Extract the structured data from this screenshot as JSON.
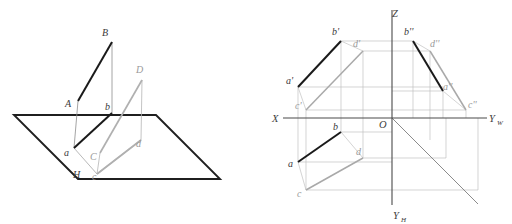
{
  "figure": {
    "colors": {
      "dark": "#232323",
      "medium": "#6f6f6f",
      "light": "#a8a8a8",
      "axis": "#4a4a4a",
      "background": "#ffffff"
    }
  },
  "left_diagram": {
    "name": "pictorial-view",
    "plane_label": "H",
    "labels": {
      "A": "A",
      "B": "B",
      "C": "C",
      "D": "D",
      "a": "a",
      "b": "b",
      "c": "c",
      "d": "d",
      "H": "H"
    },
    "points": {
      "A": {
        "x": 78,
        "y": 101
      },
      "B": {
        "x": 112,
        "y": 42
      },
      "C": {
        "x": 100,
        "y": 153
      },
      "D": {
        "x": 142,
        "y": 80
      },
      "a": {
        "x": 74,
        "y": 148
      },
      "b": {
        "x": 112,
        "y": 113
      },
      "c": {
        "x": 97,
        "y": 174
      },
      "d": {
        "x": 141,
        "y": 140
      }
    },
    "plane_corners": [
      {
        "x": 14,
        "y": 115
      },
      {
        "x": 156,
        "y": 115
      },
      {
        "x": 220,
        "y": 179
      },
      {
        "x": 78,
        "y": 179
      }
    ],
    "segments": [
      {
        "name": "AB",
        "from": "A",
        "to": "B",
        "weight": "dark"
      },
      {
        "name": "ab",
        "from": "a",
        "to": "b",
        "weight": "dark"
      },
      {
        "name": "CD",
        "from": "C",
        "to": "D",
        "weight": "light"
      },
      {
        "name": "cd",
        "from": "c",
        "to": "d",
        "weight": "light"
      },
      {
        "name": "Aa",
        "from": "A",
        "to": "a",
        "weight": "thin"
      },
      {
        "name": "Bb",
        "from": "B",
        "to": "b",
        "weight": "thin"
      },
      {
        "name": "Cc",
        "from": "C",
        "to": "c",
        "weight": "thin"
      },
      {
        "name": "Dd",
        "from": "D",
        "to": "d",
        "weight": "thin"
      }
    ]
  },
  "right_diagram": {
    "name": "three-view-projection",
    "axes": {
      "X": "X",
      "Yw": "Y",
      "Yw_sub": "W",
      "Yh": "Y",
      "Yh_sub": "H",
      "Z": "Z",
      "O": "O"
    },
    "origin": {
      "x": 392,
      "y": 118
    },
    "axis_extents": {
      "x_left": 283,
      "y_right": 487,
      "z_top": 10,
      "yh_bottom": 205
    },
    "labels": {
      "a_front": "a'",
      "b_front": "b'",
      "c_front": "c'",
      "d_front": "d'",
      "a_side": "a''",
      "b_side": "b''",
      "c_side": "c''",
      "d_side": "d''",
      "a_top": "a",
      "b_top": "b",
      "c_top": "c",
      "d_top": "d"
    },
    "points": {
      "a_front": {
        "x": 298,
        "y": 87
      },
      "b_front": {
        "x": 341,
        "y": 41
      },
      "c_front": {
        "x": 306,
        "y": 110
      },
      "d_front": {
        "x": 363,
        "y": 51
      },
      "a_side": {
        "x": 443,
        "y": 91
      },
      "b_side": {
        "x": 413,
        "y": 41
      },
      "c_side": {
        "x": 466,
        "y": 110
      },
      "d_side": {
        "x": 430,
        "y": 51
      },
      "a_top": {
        "x": 298,
        "y": 162
      },
      "b_top": {
        "x": 341,
        "y": 132
      },
      "c_top": {
        "x": 306,
        "y": 190
      },
      "d_top": {
        "x": 363,
        "y": 158
      }
    },
    "segments": [
      {
        "name": "a'b'",
        "from": "a_front",
        "to": "b_front",
        "weight": "dark"
      },
      {
        "name": "a''b''",
        "from": "a_side",
        "to": "b_side",
        "weight": "dark"
      },
      {
        "name": "ab",
        "from": "a_top",
        "to": "b_top",
        "weight": "dark"
      },
      {
        "name": "c'd'",
        "from": "c_front",
        "to": "d_front",
        "weight": "light"
      },
      {
        "name": "c''d''",
        "from": "c_side",
        "to": "d_side",
        "weight": "light"
      },
      {
        "name": "cd",
        "from": "c_top",
        "to": "d_top",
        "weight": "light"
      }
    ],
    "bisector": {
      "name": "45-degree-bisector",
      "from": {
        "x": 392,
        "y": 118
      },
      "to": {
        "x": 478,
        "y": 204
      }
    }
  }
}
